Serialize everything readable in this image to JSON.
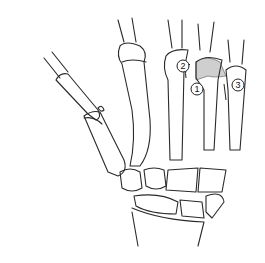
{
  "figure": {
    "background": "#ffffff",
    "line_color": "#2a2a2a",
    "fracture_fill": "#cfcfcf"
  },
  "callouts": [
    {
      "label": "2",
      "x": 183,
      "y": 66
    },
    {
      "label": "1",
      "x": 197,
      "y": 89
    },
    {
      "label": "3",
      "x": 238,
      "y": 85
    }
  ]
}
